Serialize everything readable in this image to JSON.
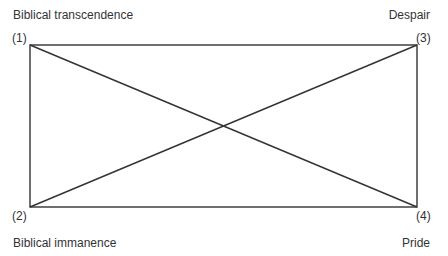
{
  "diagram": {
    "type": "square-of-opposition",
    "corners": [
      {
        "id": "1",
        "marker": "(1)",
        "label": "Biblical transcendence",
        "position": "top-left"
      },
      {
        "id": "2",
        "marker": "(2)",
        "label": "Biblical immanence",
        "position": "bottom-left"
      },
      {
        "id": "3",
        "marker": "(3)",
        "label": "Despair",
        "position": "top-right"
      },
      {
        "id": "4",
        "marker": "(4)",
        "label": "Pride",
        "position": "bottom-right"
      }
    ],
    "edges": [
      {
        "from": "1",
        "to": "3"
      },
      {
        "from": "2",
        "to": "4"
      },
      {
        "from": "1",
        "to": "2"
      },
      {
        "from": "3",
        "to": "4"
      },
      {
        "from": "1",
        "to": "4"
      },
      {
        "from": "2",
        "to": "3"
      }
    ],
    "line_color": "#333333"
  }
}
